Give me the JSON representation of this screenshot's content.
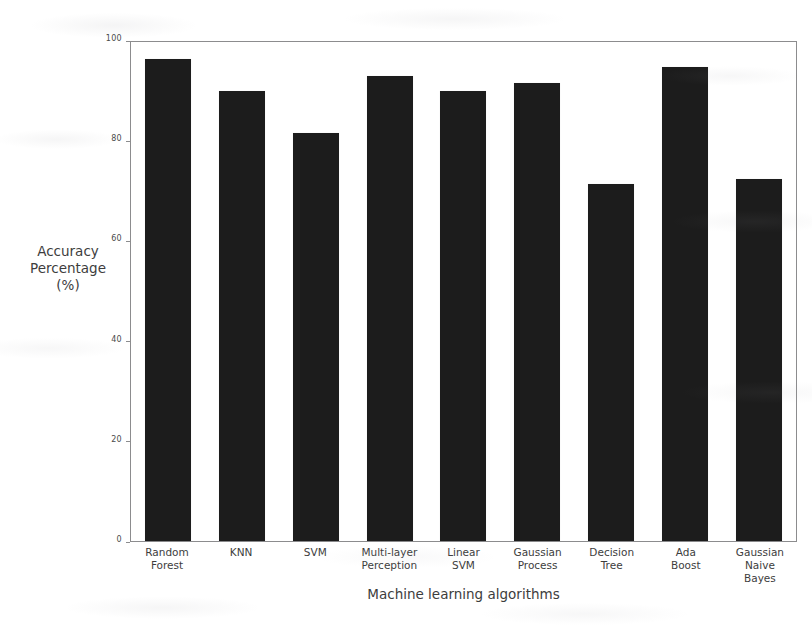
{
  "chart_data": {
    "type": "bar",
    "title": "",
    "subtitle": "",
    "xlabel": "Machine learning algorithms",
    "ylabel": "Accuracy Percentage (%)",
    "ylabel_lines": [
      "Accuracy",
      "Percentage",
      "(%)"
    ],
    "categories": [
      "Random Forest",
      "KNN",
      "SVM",
      "Multi-layer Perception",
      "Linear SVM",
      "Gaussian Process",
      "Decision Tree",
      "Ada Boost",
      "Gaussian Naive Bayes"
    ],
    "category_lines": [
      [
        "Random",
        "Forest"
      ],
      [
        "KNN"
      ],
      [
        "SVM"
      ],
      [
        "Multi-layer",
        "Perception"
      ],
      [
        "Linear",
        "SVM"
      ],
      [
        "Gaussian",
        "Process"
      ],
      [
        "Decision",
        "Tree"
      ],
      [
        "Ada",
        "Boost"
      ],
      [
        "Gaussian",
        "Naive",
        "Bayes"
      ]
    ],
    "values": [
      96.6,
      90.2,
      81.8,
      93.2,
      90.2,
      91.8,
      71.5,
      95.0,
      72.5
    ],
    "ylim": [
      0,
      100
    ],
    "yticks": [
      0,
      20,
      40,
      60,
      80,
      100
    ],
    "ytick_labels": [
      "0",
      "20",
      "40",
      "60",
      "80",
      "100"
    ],
    "grid": false,
    "legend": null,
    "bar_color": "#1c1c1c",
    "axis_color": "#8c8c8e",
    "background_color": "#ffffff"
  }
}
